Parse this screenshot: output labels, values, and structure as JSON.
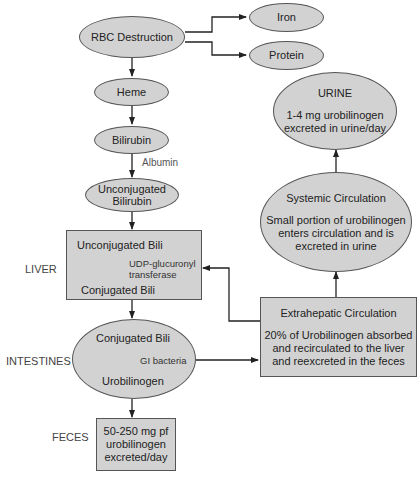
{
  "diagram": {
    "nodes": {
      "rbc_destruction": "RBC Destruction",
      "iron": "Iron",
      "protein": "Protein",
      "heme": "Heme",
      "bilirubin": "Bilirubin",
      "unconjugated_bilirubin": [
        "Unconjugated",
        "Bilirubin"
      ],
      "liver_box": {
        "top": "Unconjugated Bili",
        "enzyme": [
          "UDP-glucuronyl",
          "transferase"
        ],
        "bottom": "Conjugated Bili"
      },
      "intestine_ellipse": {
        "top": "Conjugated Bili",
        "agent": "GI bacteria",
        "bottom": "Urobilinogen"
      },
      "feces_box": [
        "50-250 mg pf",
        "urobilinogen",
        "excreted/day"
      ],
      "extrahepatic": {
        "title": "Extrahepatic Circulation",
        "text": [
          "20% of Urobilinogen absorbed",
          "and recirculated to the liver",
          "and reexcreted in the feces"
        ]
      },
      "systemic": {
        "title": "Systemic Circulation",
        "text": [
          "Small portion of urobilinogen",
          "enters circulation and is",
          "excreted in urine"
        ]
      },
      "urine": {
        "title": "URINE",
        "text": [
          "1-4 mg urobilinogen",
          "excreted in urine/day"
        ]
      }
    },
    "edge_labels": {
      "albumin": "Albumin"
    },
    "side_labels": {
      "liver": "LIVER",
      "intestines": "INTESTINES",
      "feces": "FECES"
    },
    "colors": {
      "fill": "#d2d2d2",
      "stroke": "#555555",
      "line": "#222222"
    }
  }
}
